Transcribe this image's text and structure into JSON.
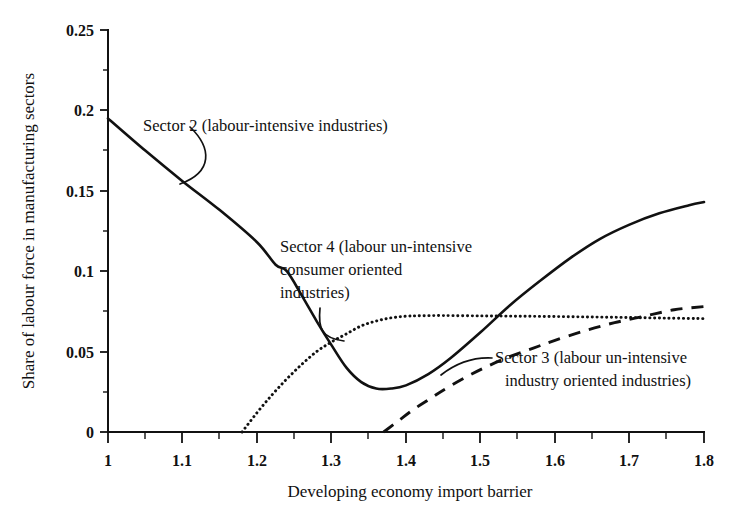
{
  "chart_data": {
    "type": "line",
    "title": "",
    "xlabel": "Developing economy import barrier",
    "ylabel": "Share of labour force in manufacturing sectors",
    "xlim": [
      1.0,
      1.8
    ],
    "ylim": [
      0,
      0.25
    ],
    "grid": false,
    "legend_position": "inline-annotations",
    "xticks": [
      "1",
      "1.1",
      "1.2",
      "1.3",
      "1.4",
      "1.5",
      "1.6",
      "1.7",
      "1.8"
    ],
    "xtick_values": [
      1.0,
      1.1,
      1.2,
      1.3,
      1.4,
      1.5,
      1.6,
      1.7,
      1.8
    ],
    "xminor_step": 0.05,
    "yticks": [
      "0",
      "0.05",
      "0.1",
      "0.15",
      "0.2",
      "0.25"
    ],
    "ytick_values": [
      0,
      0.05,
      0.1,
      0.15,
      0.2,
      0.25
    ],
    "yminor_step": 0.025,
    "series": [
      {
        "name": "Sector 2 (labour-intensive industries)",
        "style": "solid",
        "x": [
          1.0,
          1.05,
          1.1,
          1.15,
          1.2,
          1.225,
          1.24,
          1.26,
          1.28,
          1.3,
          1.32,
          1.34,
          1.36,
          1.38,
          1.4,
          1.43,
          1.46,
          1.5,
          1.54,
          1.58,
          1.62,
          1.66,
          1.7,
          1.74,
          1.78,
          1.8
        ],
        "y": [
          0.195,
          0.175,
          0.156,
          0.138,
          0.118,
          0.104,
          0.1,
          0.085,
          0.069,
          0.054,
          0.04,
          0.031,
          0.027,
          0.027,
          0.029,
          0.036,
          0.046,
          0.062,
          0.079,
          0.094,
          0.108,
          0.12,
          0.129,
          0.136,
          0.141,
          0.143
        ]
      },
      {
        "name": "Sector 4 (labour un-intensive consumer oriented industries)",
        "style": "dotted",
        "x": [
          1.18,
          1.2,
          1.22,
          1.24,
          1.26,
          1.28,
          1.3,
          1.32,
          1.34,
          1.36,
          1.38,
          1.4,
          1.42,
          1.45,
          1.5,
          1.55,
          1.6,
          1.65,
          1.7,
          1.75,
          1.8
        ],
        "y": [
          0.0,
          0.012,
          0.023,
          0.033,
          0.042,
          0.05,
          0.056,
          0.061,
          0.066,
          0.069,
          0.071,
          0.072,
          0.0723,
          0.0724,
          0.0722,
          0.072,
          0.0718,
          0.0715,
          0.0712,
          0.0708,
          0.0705
        ]
      },
      {
        "name": "Sector 3 (labour un-intensive industry oriented industries)",
        "style": "dashed",
        "x": [
          1.37,
          1.39,
          1.41,
          1.43,
          1.45,
          1.48,
          1.51,
          1.54,
          1.57,
          1.6,
          1.64,
          1.68,
          1.72,
          1.76,
          1.8
        ],
        "y": [
          0.0,
          0.007,
          0.014,
          0.02,
          0.026,
          0.034,
          0.041,
          0.047,
          0.052,
          0.057,
          0.063,
          0.068,
          0.072,
          0.076,
          0.078
        ]
      }
    ],
    "annotations": [
      {
        "id": "sector2",
        "lines": [
          "Sector 2 (labour-intensive industries)"
        ]
      },
      {
        "id": "sector4",
        "lines": [
          "Sector 4 (labour un-intensive",
          "consumer oriented",
          "industries)"
        ]
      },
      {
        "id": "sector3",
        "lines": [
          "Sector 3 (labour un-intensive",
          "industry oriented industries)"
        ]
      }
    ]
  }
}
